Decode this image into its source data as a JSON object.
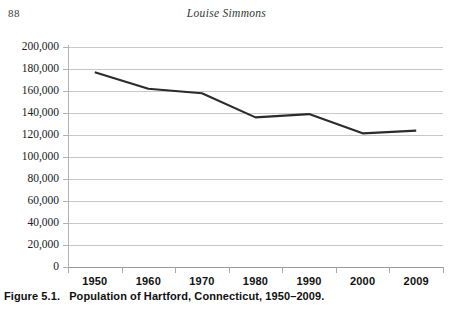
{
  "running_head": {
    "page_number": "88",
    "author": "Louise Simmons"
  },
  "caption": {
    "label": "Figure 5.1.",
    "text": "Population of Hartford, Connecticut, 1950–2009."
  },
  "chart_data": {
    "type": "line",
    "title": "Population of Hartford, Connecticut, 1950–2009.",
    "xlabel": "",
    "ylabel": "",
    "categories": [
      "1950",
      "1960",
      "1970",
      "1980",
      "1990",
      "2000",
      "2009"
    ],
    "values": [
      177000,
      162000,
      158000,
      136000,
      139000,
      121500,
      124000
    ],
    "series": [
      {
        "name": "Population of Hartford",
        "values": [
          177000,
          162000,
          158000,
          136000,
          139000,
          121500,
          124000
        ]
      }
    ],
    "ylim": [
      0,
      200000
    ],
    "ytick_values": [
      0,
      20000,
      40000,
      60000,
      80000,
      100000,
      120000,
      140000,
      160000,
      180000,
      200000
    ],
    "ytick_labels": [
      "0",
      "20,000",
      "40,000",
      "60,000",
      "80,000",
      "100,000",
      "120,000",
      "140,000",
      "160,000",
      "180,000",
      "200,000"
    ],
    "grid": true,
    "legend": false,
    "line_color": "#2b2b2b",
    "grid_color": "#c8c8c8"
  }
}
